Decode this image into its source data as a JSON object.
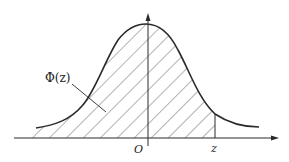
{
  "diagram": {
    "curve_label": "Φ(z)",
    "origin_label": "O",
    "z_label": "z",
    "colors": {
      "stroke": "#2a2a2a",
      "hatch": "#555555",
      "background": "#ffffff"
    },
    "shaded_region": "area under curve from -∞ to z"
  }
}
